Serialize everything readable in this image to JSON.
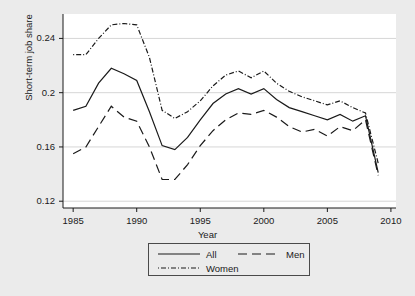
{
  "figure": {
    "background_color": "#ebebeb",
    "plot_background_color": "#ffffff",
    "line_color": "#1a1a1a"
  },
  "axes": {
    "y_label": "Short-term job share",
    "x_label": "Year",
    "y_ticks": [
      "0.12",
      "0.16",
      "0.2",
      "0.24"
    ],
    "x_ticks": [
      "1985",
      "1990",
      "1995",
      "2000",
      "2005",
      "2010"
    ]
  },
  "legend": {
    "items": [
      {
        "label": "All",
        "style": "solid"
      },
      {
        "label": "Men",
        "style": "dashed"
      },
      {
        "label": "Women",
        "style": "dash-dot"
      }
    ]
  },
  "chart_data": {
    "type": "line",
    "title": "",
    "xlabel": "Year",
    "ylabel": "Short-term job share",
    "xlim": [
      1984.2,
      1009.8
    ],
    "x_axis_range": [
      1984.2,
      2010.4
    ],
    "ylim": [
      0.115,
      0.258
    ],
    "grid": "horizontal",
    "legend_position": "below-axes",
    "x": [
      1985,
      1986,
      1987,
      1988,
      1989,
      1990,
      1991,
      1992,
      1993,
      1994,
      1995,
      1996,
      1997,
      1998,
      1999,
      2000,
      2001,
      2002,
      2003,
      2004,
      2005,
      2006,
      2007,
      2008,
      2009
    ],
    "series": [
      {
        "name": "All",
        "style": "solid",
        "values": [
          0.187,
          0.19,
          0.207,
          0.218,
          0.214,
          0.209,
          0.186,
          0.161,
          0.158,
          0.167,
          0.18,
          0.192,
          0.199,
          0.203,
          0.199,
          0.203,
          0.195,
          0.189,
          0.186,
          0.183,
          0.18,
          0.184,
          0.179,
          0.183,
          0.141
        ]
      },
      {
        "name": "Men",
        "style": "dashed",
        "values": [
          0.155,
          0.16,
          0.175,
          0.19,
          0.182,
          0.179,
          0.16,
          0.136,
          0.136,
          0.147,
          0.161,
          0.172,
          0.18,
          0.185,
          0.184,
          0.187,
          0.182,
          0.175,
          0.171,
          0.173,
          0.168,
          0.175,
          0.172,
          0.18,
          0.139
        ]
      },
      {
        "name": "Women",
        "style": "dash-dot",
        "values": [
          0.228,
          0.228,
          0.24,
          0.25,
          0.251,
          0.25,
          0.226,
          0.187,
          0.181,
          0.186,
          0.194,
          0.205,
          0.213,
          0.216,
          0.211,
          0.216,
          0.207,
          0.201,
          0.197,
          0.194,
          0.191,
          0.194,
          0.189,
          0.185,
          0.148
        ]
      }
    ]
  }
}
